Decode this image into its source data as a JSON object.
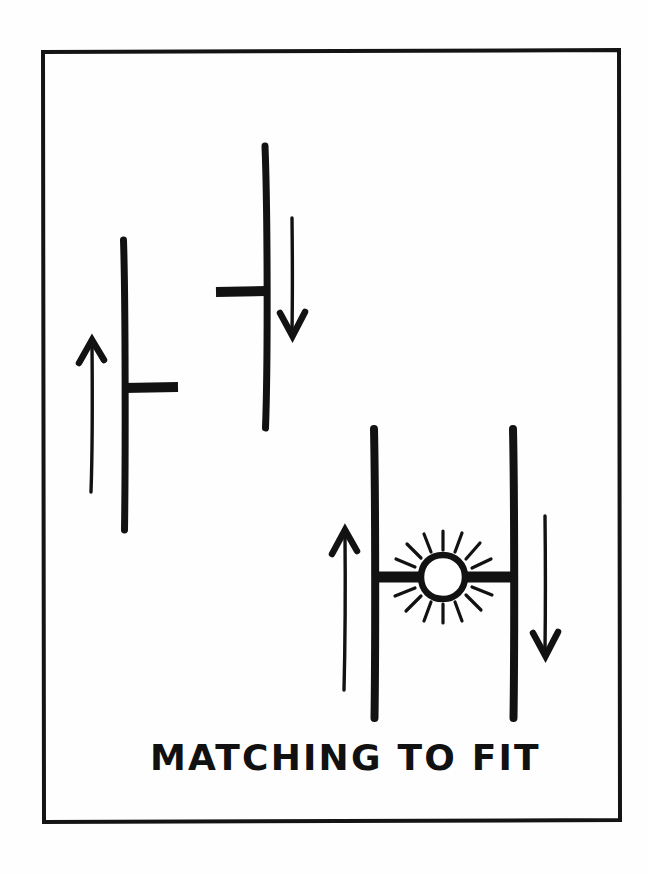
{
  "page": {
    "title": "Matching To Fit",
    "background_color": "#fefefe",
    "ink_color": "#121212",
    "width": 648,
    "height": 874
  },
  "frame": {
    "name": "drawing-border",
    "x": 42,
    "y": 50,
    "width": 578,
    "height": 772,
    "stroke_width": 4,
    "stroke_color": "#141414"
  },
  "caption": {
    "text": "MATCHING TO FIT",
    "x": 150,
    "y": 770,
    "cap_height": 30,
    "letter_spacing": 2,
    "color": "#111111"
  },
  "diagram": {
    "type": "hand-drawn-sketch",
    "groups": [
      {
        "name": "left-unmatched-connector",
        "label": "upward connector with arm pointing right",
        "post": {
          "x": 124,
          "y_top": 240,
          "y_bottom": 530,
          "stroke_width": 7
        },
        "arm": {
          "y": 388,
          "x_start": 124,
          "x_end": 178,
          "direction": "right",
          "stroke_width": 9
        },
        "arrow": {
          "name": "up-arrow",
          "x": 92,
          "y_tip": 340,
          "y_tail": 492,
          "direction": "up"
        }
      },
      {
        "name": "upper-unmatched-connector",
        "label": "downward connector with arm pointing left",
        "post": {
          "x": 266,
          "y_top": 146,
          "y_bottom": 428,
          "stroke_width": 7
        },
        "arm": {
          "y": 291,
          "x_start": 266,
          "x_end": 216,
          "direction": "left",
          "stroke_width": 9
        },
        "arrow": {
          "name": "down-arrow",
          "x": 292,
          "y_tail": 218,
          "y_tip": 336,
          "direction": "down"
        }
      },
      {
        "name": "matched-pair-connector",
        "label": "two posts joined by a bar with spark at the junction",
        "left_post": {
          "x": 374,
          "y_top": 428,
          "y_bottom": 718,
          "stroke_width": 8
        },
        "right_post": {
          "x": 513,
          "y_top": 428,
          "y_bottom": 718,
          "stroke_width": 8
        },
        "join_bar": {
          "y": 577,
          "x_start": 374,
          "x_end": 513,
          "stroke_width": 10
        },
        "arrow_up": {
          "name": "up-arrow",
          "x": 345,
          "y_tip": 530,
          "y_tail": 690,
          "direction": "up"
        },
        "arrow_down": {
          "name": "down-arrow",
          "x": 545,
          "y_tail": 516,
          "y_tip": 656,
          "direction": "down"
        },
        "spark": {
          "name": "spark-burst",
          "center_x": 443,
          "center_y": 577,
          "radius": 21,
          "ring_width": 6,
          "ray_count": 14,
          "ray_inner": 27,
          "ray_outer": 45
        }
      }
    ]
  }
}
